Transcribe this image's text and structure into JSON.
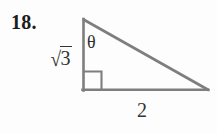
{
  "figure": {
    "problem_number": "18.",
    "shape": "right-triangle",
    "stroke_color": "#7e7e7e",
    "text_color": "#2b2b2b",
    "background_color": "#fdfdfd",
    "vertices": {
      "top": [
        83,
        19
      ],
      "bottom_left": [
        83,
        90
      ],
      "bottom_right": [
        208,
        90
      ]
    },
    "labels": {
      "vertical_leg": "√3",
      "vertical_leg_radical_sign": "√",
      "vertical_leg_radicand": "3",
      "angle": "θ",
      "base": "2"
    },
    "right_angle_marker": {
      "present": true,
      "size": 18,
      "corner": "bottom-left"
    }
  }
}
